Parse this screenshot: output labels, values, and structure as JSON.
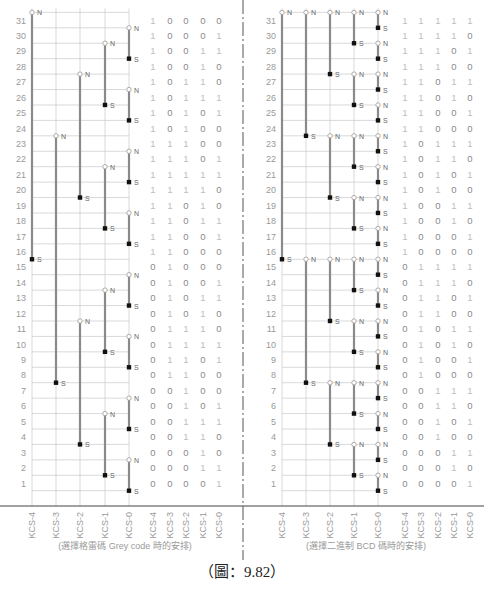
{
  "figure": {
    "caption": "（圖：9.82）",
    "colors": {
      "grid": "#c8c8c8",
      "bar": "#8a8a8a",
      "label": "#9a9a9a",
      "axis": "#444444",
      "divider": "#555555"
    }
  },
  "positions": [
    31,
    30,
    29,
    28,
    27,
    26,
    25,
    24,
    23,
    22,
    21,
    20,
    19,
    18,
    17,
    16,
    15,
    14,
    13,
    12,
    11,
    10,
    9,
    8,
    7,
    6,
    5,
    4,
    3,
    2,
    1
  ],
  "column_labels": [
    "KCS-4",
    "KCS-3",
    "KCS-2",
    "KCS-1",
    "KCS-0"
  ],
  "left": {
    "subtitle": "(選擇格雷碼 Grey code 時的安排)",
    "codes": [
      "10000",
      "10001",
      "10011",
      "10010",
      "10110",
      "10111",
      "10101",
      "10100",
      "11100",
      "11101",
      "11111",
      "11110",
      "11010",
      "11011",
      "11001",
      "11000",
      "01000",
      "01001",
      "01011",
      "01010",
      "01110",
      "01111",
      "01101",
      "01100",
      "00100",
      "00101",
      "00111",
      "00110",
      "00010",
      "00011",
      "00001"
    ],
    "magnets": [
      {
        "col": 0,
        "n": 31.5,
        "s": 15.5
      },
      {
        "col": 1,
        "n": 23.5,
        "s": 7.5
      },
      {
        "col": 2,
        "n": 27.5,
        "s": 19.5
      },
      {
        "col": 2,
        "n": 11.5,
        "s": 3.5
      },
      {
        "col": 3,
        "n": 29.5,
        "s": 25.5
      },
      {
        "col": 3,
        "n": 21.5,
        "s": 17.5
      },
      {
        "col": 3,
        "n": 13.5,
        "s": 9.5
      },
      {
        "col": 3,
        "n": 5.5,
        "s": 1.5
      },
      {
        "col": 4,
        "n": 30.5,
        "s": 28.5
      },
      {
        "col": 4,
        "n": 26.5,
        "s": 24.5
      },
      {
        "col": 4,
        "n": 22.5,
        "s": 20.5
      },
      {
        "col": 4,
        "n": 18.5,
        "s": 16.5
      },
      {
        "col": 4,
        "n": 14.5,
        "s": 12.5
      },
      {
        "col": 4,
        "n": 10.5,
        "s": 8.5
      },
      {
        "col": 4,
        "n": 6.5,
        "s": 4.5
      },
      {
        "col": 4,
        "n": 2.5,
        "s": 0.5
      }
    ]
  },
  "right": {
    "subtitle": "(選擇二進制 BCD 碼時的安排)",
    "codes": [
      "11111",
      "11110",
      "11101",
      "11100",
      "11011",
      "11010",
      "11001",
      "11000",
      "10111",
      "10110",
      "10101",
      "10100",
      "10011",
      "10010",
      "10001",
      "10000",
      "01111",
      "01110",
      "01101",
      "01100",
      "01011",
      "01010",
      "01001",
      "01000",
      "00111",
      "00110",
      "00101",
      "00100",
      "00011",
      "00010",
      "00001"
    ],
    "magnets": [
      {
        "col": 0,
        "n": 31.5,
        "s": 15.5
      },
      {
        "col": 1,
        "n": 31.5,
        "s": 23.5
      },
      {
        "col": 1,
        "n": 15.5,
        "s": 7.5
      },
      {
        "col": 2,
        "n": 31.5,
        "s": 27.5
      },
      {
        "col": 2,
        "n": 23.5,
        "s": 19.5
      },
      {
        "col": 2,
        "n": 15.5,
        "s": 11.5
      },
      {
        "col": 2,
        "n": 7.5,
        "s": 3.5
      },
      {
        "col": 3,
        "n": 31.5,
        "s": 29.5
      },
      {
        "col": 3,
        "n": 27.5,
        "s": 25.5
      },
      {
        "col": 3,
        "n": 23.5,
        "s": 21.5
      },
      {
        "col": 3,
        "n": 19.5,
        "s": 17.5
      },
      {
        "col": 3,
        "n": 15.5,
        "s": 13.5
      },
      {
        "col": 3,
        "n": 11.5,
        "s": 9.5
      },
      {
        "col": 3,
        "n": 7.5,
        "s": 5.5
      },
      {
        "col": 3,
        "n": 3.5,
        "s": 1.5
      },
      {
        "col": 4,
        "n": 31.5,
        "s": 30.5
      },
      {
        "col": 4,
        "n": 29.5,
        "s": 28.5
      },
      {
        "col": 4,
        "n": 27.5,
        "s": 26.5
      },
      {
        "col": 4,
        "n": 25.5,
        "s": 24.5
      },
      {
        "col": 4,
        "n": 23.5,
        "s": 22.5
      },
      {
        "col": 4,
        "n": 21.5,
        "s": 20.5
      },
      {
        "col": 4,
        "n": 19.5,
        "s": 18.5
      },
      {
        "col": 4,
        "n": 17.5,
        "s": 16.5
      },
      {
        "col": 4,
        "n": 15.5,
        "s": 14.5
      },
      {
        "col": 4,
        "n": 13.5,
        "s": 12.5
      },
      {
        "col": 4,
        "n": 11.5,
        "s": 10.5
      },
      {
        "col": 4,
        "n": 9.5,
        "s": 8.5
      },
      {
        "col": 4,
        "n": 7.5,
        "s": 6.5
      },
      {
        "col": 4,
        "n": 5.5,
        "s": 4.5
      },
      {
        "col": 4,
        "n": 3.5,
        "s": 2.5
      },
      {
        "col": 4,
        "n": 1.5,
        "s": 0.5
      }
    ]
  },
  "marker_labels": {
    "north": "N",
    "south": "S"
  }
}
